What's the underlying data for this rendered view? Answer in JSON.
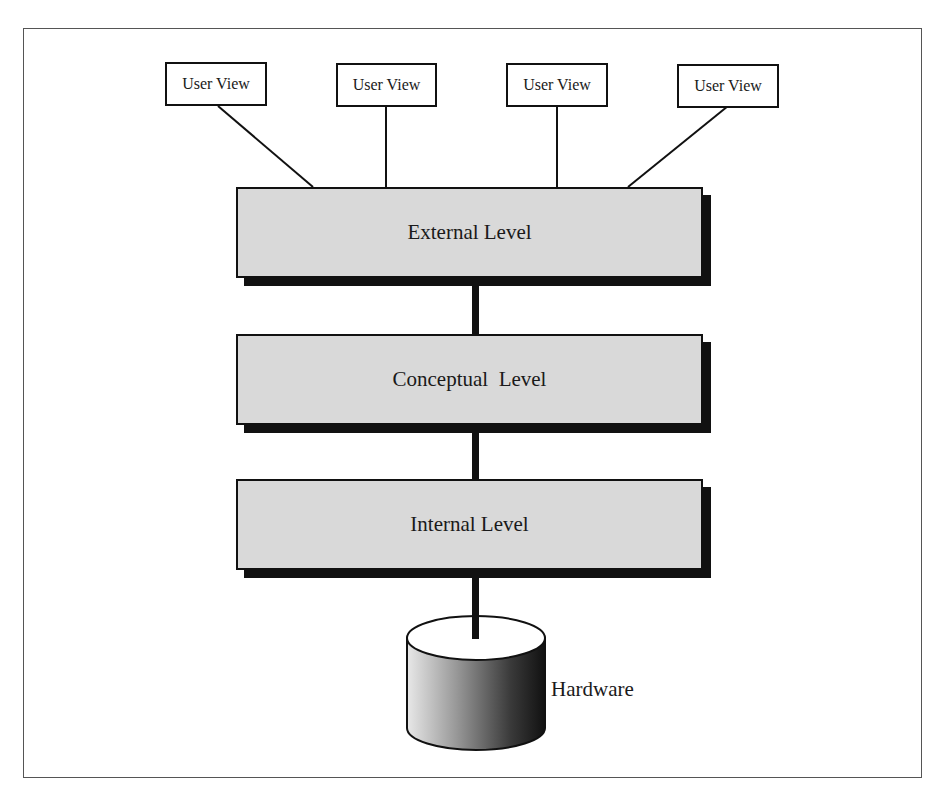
{
  "diagram": {
    "title": "",
    "user_views": [
      {
        "label": "User View"
      },
      {
        "label": "User View"
      },
      {
        "label": "User View"
      },
      {
        "label": "User View"
      }
    ],
    "levels": [
      {
        "label": "External Level"
      },
      {
        "label": "Conceptual  Level"
      },
      {
        "label": "Internal Level"
      }
    ],
    "storage": {
      "label": "Hardware",
      "icon": "database-cylinder-icon"
    },
    "colors": {
      "level_fill": "#d9d9d9",
      "shadow": "#111111",
      "line": "#111111"
    }
  }
}
